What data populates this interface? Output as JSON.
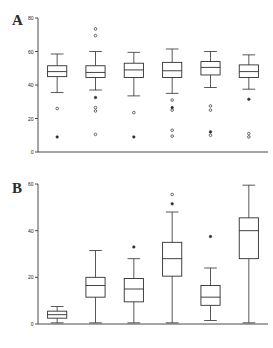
{
  "figure": {
    "panels": [
      {
        "id": "A",
        "letter": "A"
      },
      {
        "id": "B",
        "letter": "B"
      }
    ]
  },
  "chart_data": [
    {
      "type": "box",
      "panel": "A",
      "title": "A",
      "xlabel": "",
      "ylabel": "",
      "ylim": [
        0,
        80
      ],
      "yticks": [
        0,
        20,
        40,
        60,
        80
      ],
      "ytick_labels": [
        "0",
        "20",
        "40",
        "60",
        "80"
      ],
      "grid": false,
      "legend": false,
      "n_boxes": 6,
      "categories": [
        "1",
        "2",
        "3",
        "4",
        "5",
        "6"
      ],
      "boxes": [
        {
          "name": "1",
          "whisker_low": 35.5,
          "q1": 45.0,
          "median": 48.0,
          "q3": 51.5,
          "whisker_high": 58.5,
          "outliers": [
            {
              "value": 26.0,
              "style": "open"
            },
            {
              "value": 9.0,
              "style": "filled"
            }
          ]
        },
        {
          "name": "2",
          "whisker_low": 37.0,
          "q1": 44.5,
          "median": 47.5,
          "q3": 51.5,
          "whisker_high": 60.0,
          "outliers": [
            {
              "value": 73.5,
              "style": "open"
            },
            {
              "value": 69.5,
              "style": "open"
            },
            {
              "value": 32.5,
              "style": "filled"
            },
            {
              "value": 26.5,
              "style": "open"
            },
            {
              "value": 24.5,
              "style": "open"
            },
            {
              "value": 10.5,
              "style": "open"
            }
          ]
        },
        {
          "name": "3",
          "whisker_low": 33.5,
          "q1": 44.5,
          "median": 49.0,
          "q3": 53.0,
          "whisker_high": 59.5,
          "outliers": [
            {
              "value": 23.5,
              "style": "open"
            },
            {
              "value": 9.0,
              "style": "filled"
            }
          ]
        },
        {
          "name": "4",
          "whisker_low": 35.0,
          "q1": 44.5,
          "median": 48.5,
          "q3": 53.5,
          "whisker_high": 61.5,
          "outliers": [
            {
              "value": 31.0,
              "style": "open"
            },
            {
              "value": 26.5,
              "style": "filled"
            },
            {
              "value": 25.0,
              "style": "open"
            },
            {
              "value": 13.0,
              "style": "open"
            },
            {
              "value": 9.5,
              "style": "open"
            }
          ]
        },
        {
          "name": "5",
          "whisker_low": 38.5,
          "q1": 46.0,
          "median": 50.5,
          "q3": 54.0,
          "whisker_high": 60.0,
          "outliers": [
            {
              "value": 27.5,
              "style": "open"
            },
            {
              "value": 25.0,
              "style": "open"
            },
            {
              "value": 12.0,
              "style": "filled"
            },
            {
              "value": 10.0,
              "style": "open"
            }
          ]
        },
        {
          "name": "6",
          "whisker_low": 37.5,
          "q1": 44.5,
          "median": 48.0,
          "q3": 52.0,
          "whisker_high": 58.0,
          "outliers": [
            {
              "value": 31.5,
              "style": "filled"
            },
            {
              "value": 11.0,
              "style": "open"
            },
            {
              "value": 9.0,
              "style": "open"
            }
          ]
        }
      ]
    },
    {
      "type": "box",
      "panel": "B",
      "title": "B",
      "xlabel": "",
      "ylabel": "",
      "ylim": [
        0,
        60
      ],
      "yticks": [
        0,
        20,
        40,
        60
      ],
      "ytick_labels": [
        "0",
        "20",
        "40",
        "60"
      ],
      "grid": false,
      "legend": false,
      "n_boxes": 6,
      "categories": [
        "1",
        "2",
        "3",
        "4",
        "5",
        "6"
      ],
      "boxes": [
        {
          "name": "1",
          "whisker_low": 0.5,
          "q1": 2.5,
          "median": 4.0,
          "q3": 5.5,
          "whisker_high": 7.5,
          "outliers": []
        },
        {
          "name": "2",
          "whisker_low": 0.5,
          "q1": 11.5,
          "median": 16.5,
          "q3": 20.0,
          "whisker_high": 31.5,
          "outliers": []
        },
        {
          "name": "3",
          "whisker_low": 0.5,
          "q1": 9.5,
          "median": 15.0,
          "q3": 19.5,
          "whisker_high": 28.0,
          "outliers": [
            {
              "value": 33.0,
              "style": "filled"
            }
          ]
        },
        {
          "name": "4",
          "whisker_low": 0.5,
          "q1": 20.5,
          "median": 28.0,
          "q3": 35.0,
          "whisker_high": 48.0,
          "outliers": [
            {
              "value": 55.5,
              "style": "open"
            },
            {
              "value": 51.5,
              "style": "filled"
            }
          ]
        },
        {
          "name": "5",
          "whisker_low": 1.5,
          "q1": 8.0,
          "median": 11.5,
          "q3": 16.5,
          "whisker_high": 24.0,
          "outliers": [
            {
              "value": 37.5,
              "style": "filled"
            }
          ]
        },
        {
          "name": "6",
          "whisker_low": 0.5,
          "q1": 28.0,
          "median": 40.0,
          "q3": 45.5,
          "whisker_high": 59.5,
          "outliers": []
        }
      ]
    }
  ]
}
